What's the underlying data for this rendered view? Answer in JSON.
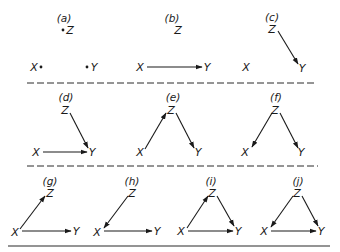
{
  "panels": [
    {
      "id": "a",
      "label": "(a)",
      "label_pos": [
        64,
        22
      ],
      "nodes": {
        "Z": {
          "text": "Z",
          "x": 70,
          "y": 34,
          "dot": "left"
        },
        "X": {
          "text": "X",
          "x": 34,
          "y": 71,
          "dot": "right"
        },
        "Y": {
          "text": "Y",
          "x": 94,
          "y": 71,
          "dot": "left"
        }
      },
      "edges": []
    },
    {
      "id": "b",
      "label": "(b)",
      "label_pos": [
        172,
        22
      ],
      "nodes": {
        "Z": {
          "text": "Z",
          "x": 178,
          "y": 34
        },
        "X": {
          "text": "X",
          "x": 140,
          "y": 71
        },
        "Y": {
          "text": "Y",
          "x": 207,
          "y": 71
        }
      },
      "edges": [
        {
          "from": "X",
          "to": "Y",
          "x1": 147,
          "y1": 67,
          "x2": 202,
          "y2": 67
        }
      ]
    },
    {
      "id": "c",
      "label": "(c)",
      "label_pos": [
        272,
        21
      ],
      "nodes": {
        "Z": {
          "text": "Z",
          "x": 272,
          "y": 33
        },
        "X": {
          "text": "X",
          "x": 246,
          "y": 71
        },
        "Y": {
          "text": "Y",
          "x": 302,
          "y": 72
        }
      },
      "edges": [
        {
          "from": "Z",
          "to": "Y",
          "x1": 278,
          "y1": 31,
          "x2": 298,
          "y2": 64
        }
      ]
    },
    {
      "id": "d",
      "label": "(d)",
      "label_pos": [
        66,
        101
      ],
      "nodes": {
        "Z": {
          "text": "Z",
          "x": 65,
          "y": 114
        },
        "X": {
          "text": "X",
          "x": 36,
          "y": 156
        },
        "Y": {
          "text": "Y",
          "x": 92,
          "y": 156
        }
      },
      "edges": [
        {
          "from": "Z",
          "to": "Y",
          "x1": 70,
          "y1": 113,
          "x2": 88,
          "y2": 148
        },
        {
          "from": "X",
          "to": "Y",
          "x1": 43,
          "y1": 152,
          "x2": 87,
          "y2": 152
        }
      ]
    },
    {
      "id": "e",
      "label": "(e)",
      "label_pos": [
        173,
        101
      ],
      "nodes": {
        "Z": {
          "text": "Z",
          "x": 171,
          "y": 114
        },
        "X": {
          "text": "X",
          "x": 140,
          "y": 156
        },
        "Y": {
          "text": "Y",
          "x": 198,
          "y": 156
        }
      },
      "edges": [
        {
          "from": "X",
          "to": "Z",
          "x1": 145,
          "y1": 149,
          "x2": 166,
          "y2": 113
        },
        {
          "from": "Z",
          "to": "Y",
          "x1": 176,
          "y1": 113,
          "x2": 194,
          "y2": 148
        }
      ]
    },
    {
      "id": "f",
      "label": "(f)",
      "label_pos": [
        276,
        101
      ],
      "nodes": {
        "Z": {
          "text": "Z",
          "x": 275,
          "y": 114
        },
        "X": {
          "text": "X",
          "x": 245,
          "y": 156
        },
        "Y": {
          "text": "Y",
          "x": 301,
          "y": 156
        }
      },
      "edges": [
        {
          "from": "Z",
          "to": "X",
          "x1": 272,
          "y1": 113,
          "x2": 252,
          "y2": 147
        },
        {
          "from": "Z",
          "to": "Y",
          "x1": 280,
          "y1": 113,
          "x2": 298,
          "y2": 148
        }
      ]
    },
    {
      "id": "g",
      "label": "(g)",
      "label_pos": [
        50,
        185
      ],
      "nodes": {
        "Z": {
          "text": "Z",
          "x": 50,
          "y": 197
        },
        "X": {
          "text": "X",
          "x": 15,
          "y": 236
        },
        "Y": {
          "text": "Y",
          "x": 76,
          "y": 235
        }
      },
      "edges": [
        {
          "from": "X",
          "to": "Z",
          "x1": 20,
          "y1": 229,
          "x2": 45,
          "y2": 196
        },
        {
          "from": "X",
          "to": "Y",
          "x1": 22,
          "y1": 231,
          "x2": 71,
          "y2": 231
        }
      ]
    },
    {
      "id": "h",
      "label": "(h)",
      "label_pos": [
        132,
        185
      ],
      "nodes": {
        "Z": {
          "text": "Z",
          "x": 132,
          "y": 197
        },
        "X": {
          "text": "X",
          "x": 97,
          "y": 236
        },
        "Y": {
          "text": "Y",
          "x": 157,
          "y": 235
        }
      },
      "edges": [
        {
          "from": "Z",
          "to": "X",
          "x1": 128,
          "y1": 196,
          "x2": 104,
          "y2": 228
        },
        {
          "from": "X",
          "to": "Y",
          "x1": 104,
          "y1": 231,
          "x2": 152,
          "y2": 231
        }
      ]
    },
    {
      "id": "i",
      "label": "(i)",
      "label_pos": [
        211,
        185
      ],
      "nodes": {
        "Z": {
          "text": "Z",
          "x": 212,
          "y": 197
        },
        "X": {
          "text": "X",
          "x": 181,
          "y": 235
        },
        "Y": {
          "text": "Y",
          "x": 238,
          "y": 235
        }
      },
      "edges": [
        {
          "from": "X",
          "to": "Z",
          "x1": 187,
          "y1": 228,
          "x2": 208,
          "y2": 196
        },
        {
          "from": "Z",
          "to": "Y",
          "x1": 217,
          "y1": 196,
          "x2": 234,
          "y2": 226
        },
        {
          "from": "X",
          "to": "Y",
          "x1": 188,
          "y1": 231,
          "x2": 233,
          "y2": 231
        }
      ]
    },
    {
      "id": "j",
      "label": "(j)",
      "label_pos": [
        298,
        185
      ],
      "nodes": {
        "Z": {
          "text": "Z",
          "x": 297,
          "y": 197
        },
        "X": {
          "text": "X",
          "x": 264,
          "y": 235
        },
        "Y": {
          "text": "Y",
          "x": 321,
          "y": 235
        }
      },
      "edges": [
        {
          "from": "Z",
          "to": "X",
          "x1": 293,
          "y1": 196,
          "x2": 271,
          "y2": 227
        },
        {
          "from": "Z",
          "to": "Y",
          "x1": 302,
          "y1": 196,
          "x2": 318,
          "y2": 226
        },
        {
          "from": "X",
          "to": "Y",
          "x1": 271,
          "y1": 231,
          "x2": 316,
          "y2": 231
        }
      ]
    }
  ],
  "separators": [
    {
      "type": "dashed",
      "x1": 27,
      "x2": 316,
      "y": 83
    },
    {
      "type": "dashed",
      "x1": 27,
      "x2": 318,
      "y": 166
    },
    {
      "type": "solid",
      "x1": 8,
      "x2": 330,
      "y": 246
    }
  ]
}
